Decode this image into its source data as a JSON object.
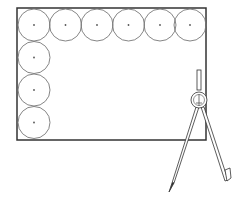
{
  "diagram": {
    "rectangle": {
      "x": 17,
      "y": 8,
      "width": 189,
      "height": 132,
      "stroke": "#333333"
    },
    "circle_radius": 16,
    "circle_stroke": "#777777",
    "top_row_circles": [
      {
        "cx": 34,
        "cy": 25
      },
      {
        "cx": 65.5,
        "cy": 25
      },
      {
        "cx": 97,
        "cy": 25
      },
      {
        "cx": 128.5,
        "cy": 25
      },
      {
        "cx": 160,
        "cy": 25
      },
      {
        "cx": 190,
        "cy": 25
      }
    ],
    "left_column_circles": [
      {
        "cx": 34,
        "cy": 57.5
      },
      {
        "cx": 34,
        "cy": 90
      },
      {
        "cx": 34,
        "cy": 122.5
      }
    ],
    "compass": {
      "label": "compass",
      "hinge_cx": 199,
      "hinge_cy": 100
    }
  }
}
